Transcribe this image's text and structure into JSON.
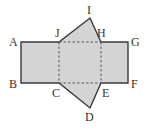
{
  "diagram": {
    "type": "net-of-triangular-prism",
    "colors": {
      "fill": "#d4d4d4",
      "stroke": "#3a3a3a",
      "dashed": "#555555",
      "label": "#333333"
    },
    "points": {
      "A": {
        "x": 21,
        "y": 42
      },
      "B": {
        "x": 21,
        "y": 83
      },
      "C": {
        "x": 59,
        "y": 83
      },
      "D": {
        "x": 90,
        "y": 108
      },
      "E": {
        "x": 101,
        "y": 83
      },
      "F": {
        "x": 128,
        "y": 83
      },
      "G": {
        "x": 128,
        "y": 42
      },
      "H": {
        "x": 101,
        "y": 42
      },
      "I": {
        "x": 90,
        "y": 18
      },
      "J": {
        "x": 59,
        "y": 42
      }
    },
    "labels": [
      {
        "id": "A",
        "text": "A",
        "x": 9,
        "y": 46
      },
      {
        "id": "B",
        "text": "B",
        "x": 9,
        "y": 88
      },
      {
        "id": "C",
        "text": "C",
        "x": 52,
        "y": 97
      },
      {
        "id": "D",
        "text": "D",
        "x": 85,
        "y": 121
      },
      {
        "id": "E",
        "text": "E",
        "x": 102,
        "y": 97
      },
      {
        "id": "F",
        "text": "F",
        "x": 131,
        "y": 88
      },
      {
        "id": "G",
        "text": "G",
        "x": 131,
        "y": 46
      },
      {
        "id": "H",
        "text": "H",
        "x": 97,
        "y": 37
      },
      {
        "id": "I",
        "text": "I",
        "x": 87,
        "y": 14
      },
      {
        "id": "J",
        "text": "J",
        "x": 55,
        "y": 37
      }
    ]
  }
}
